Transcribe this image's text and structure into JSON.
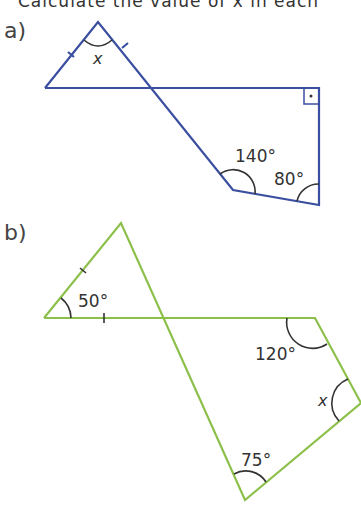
{
  "header": {
    "text": "Calculate the value of x in each"
  },
  "parts": [
    {
      "label": "a)",
      "color": "#3b4fa0",
      "angles": {
        "apex": "x",
        "obtuse": "140°",
        "acute": "80°",
        "right_angle_marker": "right-angle"
      }
    },
    {
      "label": "b)",
      "color": "#8cc04a",
      "angles": {
        "left": "50°",
        "top_right": "120°",
        "right": "x",
        "bottom": "75°"
      }
    }
  ]
}
